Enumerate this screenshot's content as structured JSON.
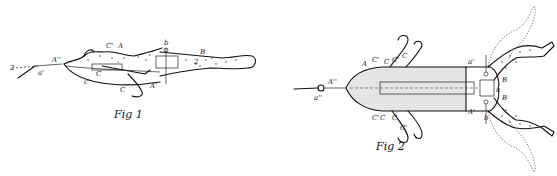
{
  "figures": [
    {
      "id": "fig1",
      "caption": "Fig 1",
      "view": "side",
      "labels": {
        "eyelet": "a'",
        "line_end": "2",
        "nose": "A''",
        "top_body": "A",
        "hook_top": "C'",
        "shank": "C",
        "hook_bottom": "C",
        "belly": "c'",
        "body_lower": "A'",
        "pin": "b",
        "leg": "B",
        "leg_inner": "2"
      }
    },
    {
      "id": "fig2",
      "caption": "Fig 2",
      "view": "top",
      "labels": {
        "eyelet": "a''",
        "nose": "A''",
        "top_left": "A",
        "hook_top_1": "C'",
        "hook_top_2": "C",
        "hook_top_3": "C'",
        "hook_top_4": "C",
        "hook_bot_1": "C'",
        "hook_bot_2": "C",
        "hook_bot_3": "C",
        "hook_bot_4": "C'",
        "joint_top": "a'",
        "leg_top": "B",
        "hinge": "a",
        "leg_bottom": "B",
        "body_lower": "A'",
        "pin": "b"
      }
    }
  ]
}
